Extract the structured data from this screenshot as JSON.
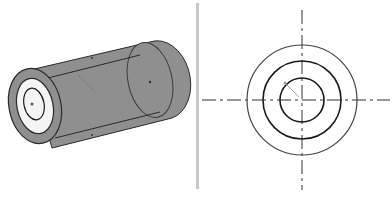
{
  "diagram": {
    "type": "engineering-drawing",
    "panels": [
      {
        "name": "isometric-view",
        "description": "Hollow cylinder (tube) shown in 3D"
      },
      {
        "name": "front-view",
        "description": "End view with three concentric circles and dashed centerlines"
      }
    ],
    "colors": {
      "body_fill": "#8f8f8f",
      "line": "#2a2a2a",
      "divider": "#c8c8c8",
      "background": "#ffffff"
    },
    "front_view": {
      "center": [
        302,
        100
      ],
      "radii": {
        "outer": 55,
        "middle": 39,
        "inner": 22
      }
    }
  }
}
